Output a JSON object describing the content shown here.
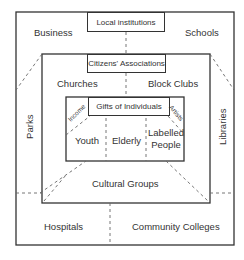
{
  "diagram": {
    "outer": {
      "title": "Local institutions",
      "labels": {
        "top_left": "Business",
        "top_right": "Schools",
        "left": "Parks",
        "right": "Libraries",
        "bottom_left": "Hospitals",
        "bottom_right": "Community Colleges"
      }
    },
    "middle": {
      "title": "Citizens' Associations",
      "labels": {
        "top_left": "Churches",
        "top_right": "Block Clubs",
        "bottom": "Cultural Groups"
      }
    },
    "inner": {
      "title": "Gifts of Individuals",
      "corner_labels": {
        "left": "Income",
        "right": "Artists"
      },
      "cells": [
        "Youth",
        "Elderly",
        "Labelled\nPeople"
      ]
    },
    "colors": {
      "line": "#333333",
      "background": "#ffffff"
    }
  }
}
